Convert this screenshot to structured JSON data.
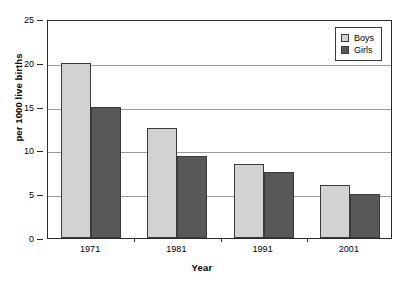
{
  "chart_data": {
    "type": "bar",
    "title": "",
    "subtitle": "",
    "xlabel": "Year",
    "ylabel": "per 1000 live births",
    "categories": [
      "1971",
      "1981",
      "1991",
      "2001"
    ],
    "series": [
      {
        "name": "Boys",
        "values": [
          20.0,
          12.6,
          8.4,
          6.1
        ],
        "color": "#d2d2d2"
      },
      {
        "name": "Girls",
        "values": [
          15.0,
          9.4,
          7.5,
          5.0
        ],
        "color": "#585858"
      }
    ],
    "ylim": [
      0,
      25
    ],
    "ytick_labels": [
      "0",
      "5",
      "10",
      "15",
      "20",
      "25"
    ],
    "ytick_values": [
      0,
      5,
      10,
      15,
      20,
      25
    ],
    "grid": "horizontal",
    "legend_position": "top-right",
    "annotations": []
  },
  "legend": {
    "items": [
      {
        "label": "Boys"
      },
      {
        "label": "Girls"
      }
    ]
  },
  "axes": {
    "y_title": "per 1000 live births",
    "x_title": "Year"
  },
  "colors": {
    "boys": "#d2d2d2",
    "girls": "#585858",
    "frame": "#2b2b2b",
    "gridline": "#9a9a9a",
    "background": "#ffffff"
  }
}
